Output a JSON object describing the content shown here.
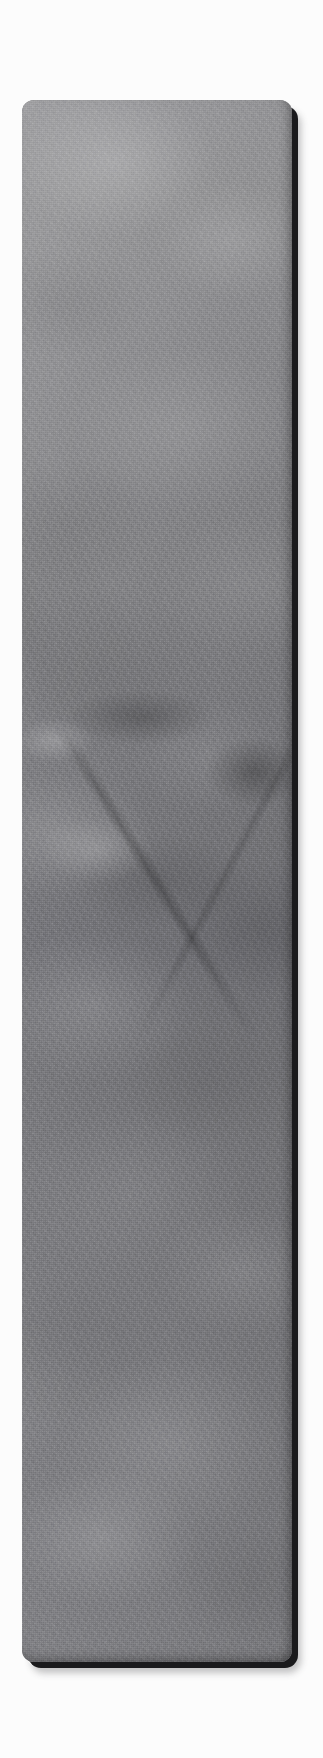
{
  "scene": {
    "title": "Stone texture swatch",
    "description": "A tall vertical rounded-rectangle card showing a mottled grey marble / stone surface, rendered as a raised tile with a hard dark edge on its right and bottom sides.",
    "canvas": {
      "width_px": 323,
      "height_px": 1758,
      "background_color": "#fcfcfc"
    }
  },
  "card": {
    "name": "stone-texture-card",
    "x_px": 22,
    "y_px": 100,
    "width_px": 270,
    "height_px": 1562,
    "corner_radius_px": 12,
    "edge_offset_px": 6,
    "edge_color": "#1a1a1c",
    "light_direction": "upper-left"
  },
  "texture": {
    "material": "grey marble / stone",
    "dominant_color": "#7e7e82",
    "lightest_color": "#b4b4b6",
    "darkest_color": "#3c3c3f",
    "features": [
      {
        "name": "upper-diagonal-vein",
        "kind": "vein",
        "position": "upper third",
        "direction": "lower-left to upper-right",
        "tone": "dark"
      },
      {
        "name": "mid-dark-band",
        "kind": "blotch",
        "position": "about 40 percent down",
        "direction": "horizontal",
        "tone": "dark"
      },
      {
        "name": "mid-bright-patch",
        "kind": "blotch",
        "position": "left edge, about 41 percent down",
        "direction": "none",
        "tone": "light"
      },
      {
        "name": "hairline-crack",
        "kind": "crack",
        "position": "middle",
        "direction": "lower-left to upper-right",
        "tone": "dark"
      },
      {
        "name": "lower-bright-streaks",
        "kind": "streaks",
        "position": "lower quarter",
        "direction": "upper-left to lower-right",
        "tone": "light"
      }
    ]
  }
}
